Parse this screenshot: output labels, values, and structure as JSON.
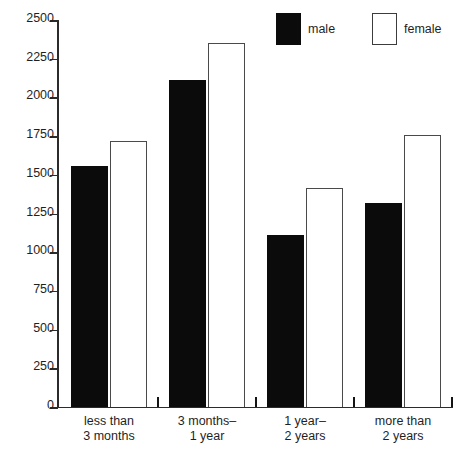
{
  "chart_data": {
    "type": "bar",
    "title": "",
    "subtitle": "",
    "xlabel": "",
    "ylabel": "",
    "categories": [
      "less than\n3 months",
      "3 months–\n1 year",
      "1 year–\n2 years",
      "more than\n2 years"
    ],
    "series": [
      {
        "name": "male",
        "color": "#0b0b0b",
        "fill": "solid",
        "values": [
          1560,
          2110,
          1110,
          1320
        ]
      },
      {
        "name": "female",
        "color": "#ffffff",
        "fill": "hollow",
        "values": [
          1720,
          2350,
          1415,
          1760
        ]
      }
    ],
    "ylim": [
      0,
      2500
    ],
    "ytick_values": [
      0,
      250,
      500,
      750,
      1000,
      1250,
      1500,
      1750,
      2000,
      2250,
      2500
    ],
    "ytick_labels": [
      "0",
      "250",
      "500",
      "750",
      "1000",
      "1250",
      "1500",
      "1750",
      "2000",
      "2250",
      "2500"
    ],
    "grid": false,
    "legend_position": "top-right",
    "legend_entries": [
      "male",
      "female"
    ]
  },
  "legend": {
    "male_label": "male",
    "female_label": "female"
  },
  "axis": {
    "tick_0": "0",
    "tick_250": "250",
    "tick_500": "500",
    "tick_750": "750",
    "tick_1000": "1000",
    "tick_1250": "1250",
    "tick_1500": "1500",
    "tick_1750": "1750",
    "tick_2000": "2000",
    "tick_2250": "2250",
    "tick_2500": "2500"
  },
  "categories": {
    "c0": "less than\n3 months",
    "c1": "3 months–\n1 year",
    "c2": "1 year–\n2 years",
    "c3": "more than\n2 years"
  }
}
